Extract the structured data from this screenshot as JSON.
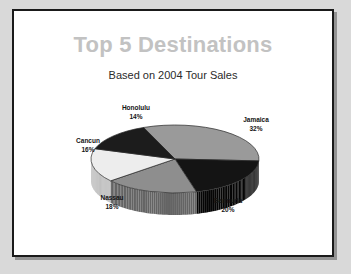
{
  "slide": {
    "title": "Top 5 Destinations",
    "subtitle": "Based on 2004 Tour Sales"
  },
  "colors": {
    "title_gray": "#c2c2c2",
    "subtitle_dark": "#2b2b2b",
    "slide_background": "#ffffff",
    "page_background": "#d9d9d9",
    "border": "#1a1a1a"
  },
  "chart_data": {
    "type": "pie",
    "title": "Top 5 Destinations",
    "subtitle": "Based on 2004 Tour Sales",
    "xlabel": "",
    "ylabel": "",
    "legend_position": "none",
    "grid": false,
    "three_d": true,
    "labels_show_name_and_percent": true,
    "categories": [
      "Jamaica",
      "Bermuda",
      "Nassau",
      "Cancun",
      "Honolulu"
    ],
    "values": [
      32,
      20,
      18,
      16,
      14
    ],
    "slices": [
      {
        "name": "Jamaica",
        "percent": 32,
        "label": "Jamaica",
        "percent_text": "32%",
        "color": "#9a9a9a",
        "side_color": "#6f6f6f"
      },
      {
        "name": "Bermuda",
        "percent": 20,
        "label": "Bermuda",
        "percent_text": "20%",
        "color": "#141414",
        "side_color": "#050505"
      },
      {
        "name": "Nassau",
        "percent": 18,
        "label": "Nassau",
        "percent_text": "18%",
        "color": "#8e8e8e",
        "side_color": "#646464"
      },
      {
        "name": "Cancun",
        "percent": 16,
        "label": "Cancun",
        "percent_text": "16%",
        "color": "#ededed",
        "side_color": "#b4b4b4"
      },
      {
        "name": "Honolulu",
        "percent": 14,
        "label": "Honolulu",
        "percent_text": "14%",
        "color": "#1c1c1c",
        "side_color": "#080808"
      }
    ]
  }
}
